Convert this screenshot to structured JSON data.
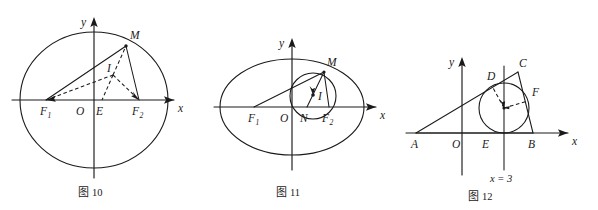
{
  "page": {
    "background_color": "#ffffff",
    "ink_color": "#1a1a1a",
    "width": 598,
    "height": 210
  },
  "figures": [
    {
      "id": "fig10",
      "caption_prefix": "图",
      "caption_number": "10",
      "caption": "图 10",
      "axis_labels": {
        "x": "x",
        "y": "y"
      },
      "points": [
        {
          "name": "M",
          "label": "M",
          "sub": ""
        },
        {
          "name": "I",
          "label": "I",
          "sub": ""
        },
        {
          "name": "F1",
          "label": "F",
          "sub": "1"
        },
        {
          "name": "O",
          "label": "O",
          "sub": ""
        },
        {
          "name": "E",
          "label": "E",
          "sub": ""
        },
        {
          "name": "F2",
          "label": "F",
          "sub": "2"
        }
      ],
      "solid_segments": [
        "F1-M",
        "M-F2"
      ],
      "dashed_segments": [
        "F1-I",
        "I-F2",
        "I-M",
        "I-E"
      ],
      "conic": "ellipse"
    },
    {
      "id": "fig11",
      "caption_prefix": "图",
      "caption_number": "11",
      "caption": "图 11",
      "axis_labels": {
        "x": "x",
        "y": "y"
      },
      "points": [
        {
          "name": "M",
          "label": "M",
          "sub": ""
        },
        {
          "name": "I",
          "label": "I",
          "sub": ""
        },
        {
          "name": "F1",
          "label": "F",
          "sub": "1"
        },
        {
          "name": "O",
          "label": "O",
          "sub": ""
        },
        {
          "name": "N",
          "label": "N",
          "sub": ""
        },
        {
          "name": "F2",
          "label": "F",
          "sub": "2"
        }
      ],
      "solid_segments": [
        "F1-M",
        "M-F2",
        "M-N"
      ],
      "dashed_segments": [],
      "conic": "ellipse",
      "inscribed": "circle"
    },
    {
      "id": "fig12",
      "caption_prefix": "图",
      "caption_number": "12",
      "caption": "图 12",
      "axis_labels": {
        "x": "x",
        "y": "y"
      },
      "vertical_line_label": "x = 3",
      "points": [
        {
          "name": "D",
          "label": "D",
          "sub": ""
        },
        {
          "name": "C",
          "label": "C",
          "sub": ""
        },
        {
          "name": "F",
          "label": "F",
          "sub": ""
        },
        {
          "name": "A",
          "label": "A",
          "sub": ""
        },
        {
          "name": "O",
          "label": "O",
          "sub": ""
        },
        {
          "name": "E",
          "label": "E",
          "sub": ""
        },
        {
          "name": "B",
          "label": "B",
          "sub": ""
        }
      ],
      "solid_segments": [
        "A-C",
        "C-B",
        "A-B",
        "vertical x=3"
      ],
      "dashed_segments": [
        "center-D",
        "center-F"
      ],
      "inscribed": "circle"
    }
  ]
}
